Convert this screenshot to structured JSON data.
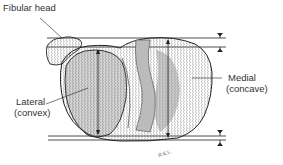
{
  "diagram": {
    "labels": {
      "fibular_head": "Fibular head",
      "lateral_line1": "Lateral",
      "lateral_line2": "(convex)",
      "medial_line1": "Medial",
      "medial_line2": "(concave)"
    },
    "signature": "R.E.L."
  },
  "colors": {
    "ink": "#222222",
    "shade": "#9a9a9a",
    "background": "#ffffff"
  }
}
